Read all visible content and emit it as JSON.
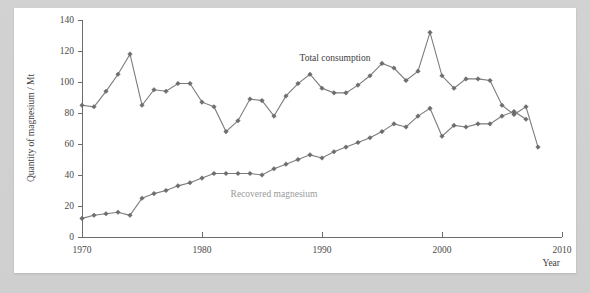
{
  "chart_data": {
    "type": "line",
    "title": "",
    "xlabel": "Year",
    "ylabel": "Quantity of magnesium / Mt",
    "xlim": [
      1970,
      2010
    ],
    "ylim": [
      0,
      140
    ],
    "xticks": [
      1970,
      1980,
      1990,
      2000,
      2010
    ],
    "yticks": [
      0,
      20,
      40,
      60,
      80,
      100,
      120,
      140
    ],
    "grid": false,
    "legend": "inline-annotations",
    "x": [
      1970,
      1971,
      1972,
      1973,
      1974,
      1975,
      1976,
      1977,
      1978,
      1979,
      1980,
      1981,
      1982,
      1983,
      1984,
      1985,
      1986,
      1987,
      1988,
      1989,
      1990,
      1991,
      1992,
      1993,
      1994,
      1995,
      1996,
      1997,
      1998,
      1999,
      2000,
      2001,
      2002,
      2003,
      2004,
      2005,
      2006,
      2007,
      2008
    ],
    "series": [
      {
        "name": "Total consumption",
        "color": "#7c7c7c",
        "values": [
          85,
          84,
          94,
          105,
          118,
          85,
          95,
          94,
          99,
          99,
          87,
          84,
          68,
          75,
          89,
          88,
          78,
          91,
          99,
          105,
          96,
          93,
          93,
          98,
          104,
          112,
          109,
          101,
          107,
          132,
          104,
          96,
          102,
          102,
          101,
          85,
          79,
          84,
          58
        ]
      },
      {
        "name": "Recovered magnesium",
        "color": "#7c7c7c",
        "values": [
          12,
          14,
          15,
          16,
          14,
          25,
          28,
          30,
          33,
          35,
          38,
          41,
          41,
          41,
          41,
          40,
          44,
          47,
          50,
          53,
          51,
          55,
          58,
          61,
          64,
          68,
          73,
          71,
          78,
          83,
          65,
          72,
          71,
          73,
          73,
          78,
          81,
          76,
          null
        ]
      }
    ],
    "annotations": [
      {
        "text": "Total consumption",
        "x_px": 333,
        "y_px": 50
      },
      {
        "text": "Recovered magnesium",
        "x_px": 263,
        "y_px": 185
      }
    ]
  },
  "axis": {
    "y_title": "Quantity of magnesium / Mt",
    "x_title": "Year",
    "y_tick_labels": [
      "140",
      "120",
      "100",
      "80",
      "60",
      "40",
      "20",
      "0"
    ],
    "x_tick_labels": [
      "1970",
      "1980",
      "1990",
      "2000",
      "2010"
    ]
  },
  "colors": {
    "series": "#7c7c7c",
    "axis": "#6b6b6b",
    "text": "#3d3d3d",
    "card": "#ffffff",
    "page_background": "#d0d0d0"
  }
}
